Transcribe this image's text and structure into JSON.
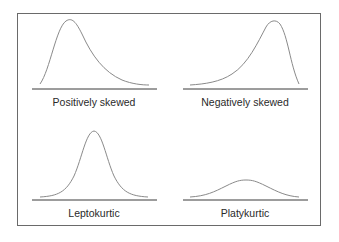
{
  "diagram": {
    "panels": [
      {
        "id": "positively-skewed",
        "label": "Positively skewed"
      },
      {
        "id": "negatively-skewed",
        "label": "Negatively skewed"
      },
      {
        "id": "leptokurtic",
        "label": "Leptokurtic"
      },
      {
        "id": "platykurtic",
        "label": "Platykurtic"
      }
    ],
    "colors": {
      "frame": "#6a6a6a",
      "curve": "#8a8a8a",
      "baseline": "#3a3a3a",
      "text": "#2a2a2a"
    }
  }
}
